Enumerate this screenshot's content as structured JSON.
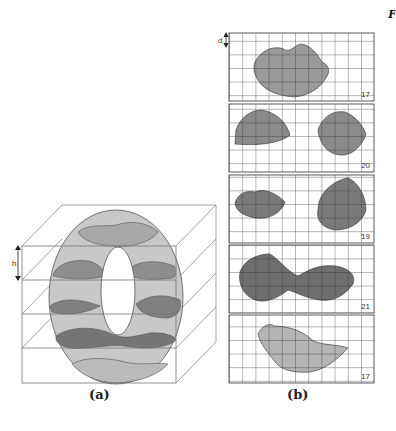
{
  "figure": {
    "corner_label": "F",
    "panel_a": {
      "caption": "(a)",
      "dimension_label": "h",
      "description": "Torus sliced by horizontal planes inside a 3D box"
    },
    "panel_b": {
      "caption": "(b)",
      "dimension_label": "d",
      "grid": {
        "cols": 11,
        "rows": 5
      },
      "slices": [
        {
          "index": 1,
          "count": "17",
          "shade": "#9a9a9a"
        },
        {
          "index": 2,
          "count": "20",
          "shade": "#8a8a8a"
        },
        {
          "index": 3,
          "count": "19",
          "shade": "#7a7a7a"
        },
        {
          "index": 4,
          "count": "21",
          "shade": "#6e6e6e"
        },
        {
          "index": 5,
          "count": "17",
          "shade": "#b4b4b4"
        }
      ]
    },
    "colors": {
      "torus_fill": "#c8c8c8",
      "band_dark": "#7a7a7a",
      "band_medium": "#9a9a9a",
      "line": "#555555",
      "grid_line": "#333333"
    }
  }
}
